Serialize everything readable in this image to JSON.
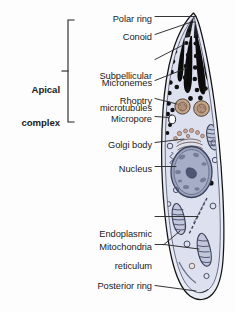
{
  "figure": {
    "background_color": "#fdfdfd"
  },
  "group_label": {
    "line1": "Apical",
    "line2": "complex",
    "bracket": "left-brace-bracket"
  },
  "labels": [
    {
      "id": "polar-ring",
      "text": "Polar ring",
      "x": 152,
      "y": 19,
      "align": "right"
    },
    {
      "id": "conoid",
      "text": "Conoid",
      "x": 152,
      "y": 37,
      "align": "right"
    },
    {
      "id": "subpellicular-l1",
      "text": "Subpellicular",
      "x": 152,
      "y": 55,
      "align": "right"
    },
    {
      "id": "subpellicular-l2",
      "text": "microtubules",
      "x": 152,
      "y": 65,
      "align": "right"
    },
    {
      "id": "micronemes",
      "text": "Micronemes",
      "x": 152,
      "y": 83,
      "align": "right"
    },
    {
      "id": "rhoptry",
      "text": "Rhoptry",
      "x": 152,
      "y": 101,
      "align": "right"
    },
    {
      "id": "micropore",
      "text": "Micropore",
      "x": 152,
      "y": 119,
      "align": "right"
    },
    {
      "id": "golgi-body",
      "text": "Golgi body",
      "x": 152,
      "y": 145,
      "align": "right"
    },
    {
      "id": "nucleus",
      "text": "Nucleus",
      "x": 152,
      "y": 169,
      "align": "right"
    },
    {
      "id": "endoplasmic-reticulum-1",
      "text": "Endoplasmic",
      "x": 152,
      "y": 213,
      "align": "right"
    },
    {
      "id": "endoplasmic-reticulum-2",
      "text": "reticulum",
      "x": 152,
      "y": 224,
      "align": "right"
    },
    {
      "id": "mitochondria",
      "text": "Mitochondria",
      "x": 152,
      "y": 247,
      "align": "right"
    },
    {
      "id": "posterior-ring",
      "text": "Posterior ring",
      "x": 152,
      "y": 288,
      "align": "right"
    }
  ],
  "colors": {
    "background": "#fdfdfd",
    "cytoplasm": "#dde0ee",
    "cytoplasm_light": "#e8eaf4",
    "pellicle_stroke": "#1a1a1a",
    "inner_membrane": "#5c6078",
    "microneme_black": "#0b0b0b",
    "microtubule_dot": "#111111",
    "rhoptry_fill": "#c4a58a",
    "rhoptry_stroke": "#4a3d31",
    "golgi_fill": "#c9a79a",
    "golgi_stroke": "#6b4f45",
    "nucleus_fill": "#9aa2bd",
    "nucleus_stroke": "#3a4058",
    "nucleolus": "#4e5673",
    "mitochondria_fill": "#c3c7dd",
    "mitochondria_stroke": "#3c4258",
    "vesicle_stroke": "#4a4f66",
    "leader_line": "#2a2a2a",
    "label_text": "#1b1b1b"
  },
  "structures": [
    {
      "id": "pellicle",
      "name": "Pellicle outer membrane"
    },
    {
      "id": "inner-membrane-complex",
      "name": "Inner membrane complex"
    },
    {
      "id": "polar-ring-structure",
      "name": "Polar ring"
    },
    {
      "id": "conoid-structure",
      "name": "Conoid"
    },
    {
      "id": "subpellicular-microtubules",
      "name": "Subpellicular microtubules (cross sections)",
      "count": 46
    },
    {
      "id": "micronemes-structure",
      "name": "Micronemes",
      "count": 4
    },
    {
      "id": "rhoptries",
      "name": "Rhoptries",
      "count": 2
    },
    {
      "id": "micropore-structure",
      "name": "Micropore"
    },
    {
      "id": "golgi-structure",
      "name": "Golgi body"
    },
    {
      "id": "nucleus-structure",
      "name": "Nucleus with nucleolus"
    },
    {
      "id": "er-structure",
      "name": "Endoplasmic reticulum"
    },
    {
      "id": "mitochondria-structure",
      "name": "Mitochondria",
      "count": 2
    },
    {
      "id": "posterior-ring-structure",
      "name": "Posterior ring"
    },
    {
      "id": "vesicles",
      "name": "Cytoplasmic vesicles"
    }
  ]
}
